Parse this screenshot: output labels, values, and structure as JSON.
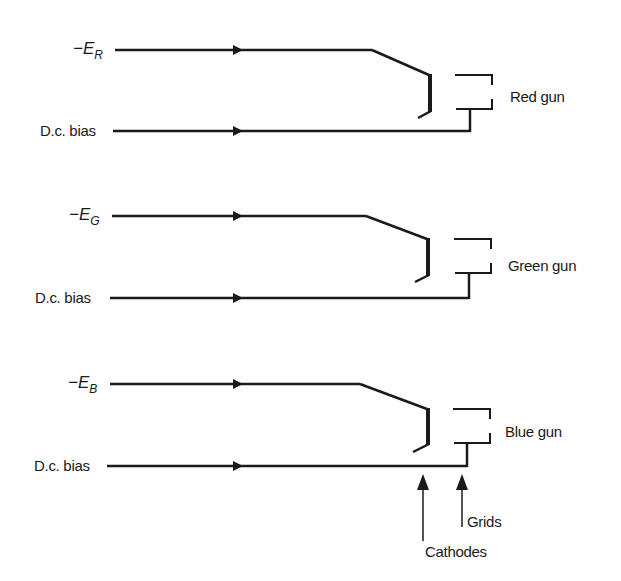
{
  "diagram": {
    "guns": [
      {
        "signal_label": "−E",
        "signal_sub": "R",
        "bias_label": "D.c. bias",
        "gun_label": "Red gun"
      },
      {
        "signal_label": "−E",
        "signal_sub": "G",
        "bias_label": "D.c. bias",
        "gun_label": "Green gun"
      },
      {
        "signal_label": "−E",
        "signal_sub": "B",
        "bias_label": "D.c. bias",
        "gun_label": "Blue gun"
      }
    ],
    "annotations": {
      "grids": "Grids",
      "cathodes": "Cathodes"
    },
    "colors": {
      "line": "#1a1a1a",
      "background": "#ffffff"
    }
  }
}
